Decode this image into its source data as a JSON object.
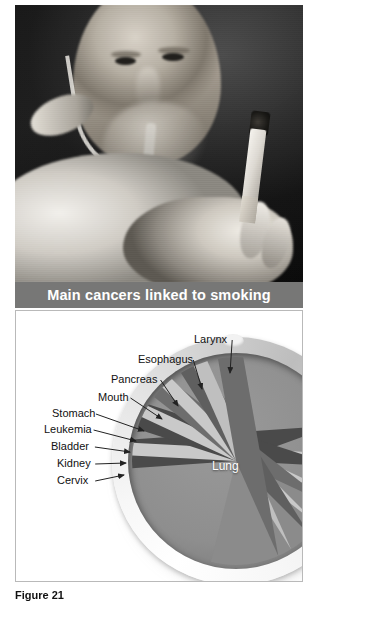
{
  "figure": {
    "caption_label": "Figure 21",
    "banner_title": "Main cancers linked to smoking"
  },
  "photo": {
    "alt": "Elderly man wearing an oxygen cannula holding a lit cigarette",
    "subject_icon": "smoker-photo-icon"
  },
  "diagram": {
    "center_label": "Lung",
    "labels": [
      {
        "text": "Larynx",
        "x": 178,
        "y": 22,
        "ax": 214,
        "ay": 62
      },
      {
        "text": "Esophagus",
        "x": 122,
        "y": 42,
        "ax": 186,
        "ay": 78
      },
      {
        "text": "Pancreas",
        "x": 95,
        "y": 62,
        "ax": 162,
        "ay": 95
      },
      {
        "text": "Mouth",
        "x": 82,
        "y": 80,
        "ax": 146,
        "ay": 108
      },
      {
        "text": "Stomach",
        "x": 36,
        "y": 96,
        "ax": 128,
        "ay": 120
      },
      {
        "text": "Leukemia",
        "x": 28,
        "y": 112,
        "ax": 120,
        "ay": 130
      },
      {
        "text": "Bladder",
        "x": 35,
        "y": 129,
        "ax": 114,
        "ay": 141
      },
      {
        "text": "Kidney",
        "x": 41,
        "y": 146,
        "ax": 110,
        "ay": 152
      },
      {
        "text": "Cervix",
        "x": 41,
        "y": 163,
        "ax": 108,
        "ay": 164
      }
    ]
  },
  "chart_data": {
    "type": "pie",
    "title": "Main cancers linked to smoking",
    "note": "Ashtray-shaped pie chart; wedge sizes are illustrative proportions of cancers linked to smoking.",
    "categories": [
      "Lung",
      "Larynx",
      "Esophagus",
      "Pancreas",
      "Mouth",
      "Stomach",
      "Leukemia",
      "Bladder",
      "Kidney",
      "Cervix"
    ],
    "values": [
      60,
      6,
      5,
      5,
      4,
      4,
      4,
      4,
      4,
      4
    ],
    "legend": "inline-labels",
    "wedges": [
      {
        "name": "Lung",
        "start_deg": 14,
        "sweep_deg": 236,
        "shade": "#8b8b8b"
      },
      {
        "name": "Larynx",
        "start_deg": 250,
        "sweep_deg": 16,
        "shade": "#4a4a4a"
      },
      {
        "name": "Esophagus",
        "start_deg": 266,
        "sweep_deg": 7,
        "shade": "#c9c9c9"
      },
      {
        "name": "Pancreas",
        "start_deg": 273,
        "sweep_deg": 15,
        "shade": "#4a4a4a"
      },
      {
        "name": "Mouth",
        "start_deg": 288,
        "sweep_deg": 7,
        "shade": "#c9c9c9"
      },
      {
        "name": "Stomach",
        "start_deg": 295,
        "sweep_deg": 13,
        "shade": "#6d6d6d"
      },
      {
        "name": "Leukemia",
        "start_deg": 308,
        "sweep_deg": 7,
        "shade": "#c9c9c9"
      },
      {
        "name": "Bladder",
        "start_deg": 315,
        "sweep_deg": 13,
        "shade": "#5f5f5f"
      },
      {
        "name": "Kidney",
        "start_deg": 328,
        "sweep_deg": 8,
        "shade": "#bfbfbf"
      },
      {
        "name": "Cervix",
        "start_deg": 336,
        "sweep_deg": 14,
        "shade": "#6d6d6d"
      }
    ]
  },
  "colors": {
    "banner_bg": "#777776",
    "banner_text": "#ffffff",
    "panel_border": "#b9b9b9",
    "page_bg": "#ffffff",
    "label_text": "#111111",
    "ashtray_bowl": "#8e8e8e"
  }
}
